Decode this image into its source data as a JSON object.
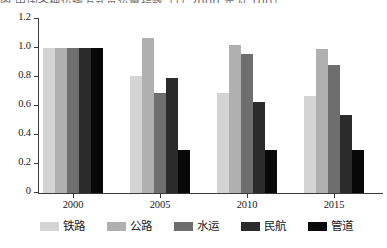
{
  "caption_remnant": "图 中国各种运输方式货运量指数（以 2000 年为 100）",
  "chart_data": {
    "type": "bar",
    "title": "",
    "subtitle": "",
    "xlabel": "",
    "ylabel": "",
    "categories": [
      "2000",
      "2005",
      "2010",
      "2015"
    ],
    "ylim": [
      0,
      1.2
    ],
    "ytick_labels": [
      "0",
      "0.2",
      "0.4",
      "0.6",
      "0.8",
      "1.0",
      "1.2"
    ],
    "ytick_values": [
      0,
      0.2,
      0.4,
      0.6,
      0.8,
      1.0,
      1.2
    ],
    "grid": false,
    "legend_position": "bottom",
    "series": [
      {
        "name": "铁路",
        "color": "#d4d4d4",
        "values": [
          1.0,
          0.81,
          0.69,
          0.67
        ]
      },
      {
        "name": "公路",
        "color": "#b0b0b0",
        "values": [
          1.0,
          1.07,
          1.02,
          0.99
        ]
      },
      {
        "name": "水运",
        "color": "#6e6e6e",
        "values": [
          1.0,
          0.69,
          0.96,
          0.88
        ]
      },
      {
        "name": "民航",
        "color": "#2b2b2b",
        "values": [
          1.0,
          0.79,
          0.63,
          0.54
        ]
      },
      {
        "name": "管道",
        "color": "#080808",
        "values": [
          1.0,
          0.3,
          0.3,
          0.3
        ]
      }
    ]
  }
}
